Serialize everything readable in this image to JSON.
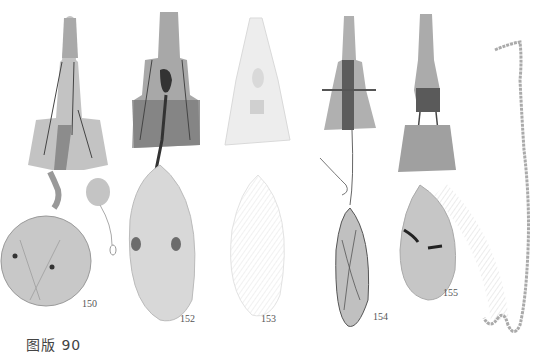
{
  "plate": {
    "caption": "图版 90",
    "figures": [
      {
        "id": "fig-150",
        "label": "150"
      },
      {
        "id": "fig-152",
        "label": "152"
      },
      {
        "id": "fig-153",
        "label": "153"
      },
      {
        "id": "fig-154",
        "label": "154"
      },
      {
        "id": "fig-155",
        "label": "155"
      },
      {
        "id": "fig-unlabeled",
        "label": ""
      }
    ]
  }
}
